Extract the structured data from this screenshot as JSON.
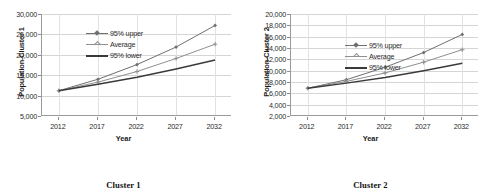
{
  "figure": {
    "panels": [
      {
        "caption": "Cluster 1",
        "ylabel": "Population-Cluster 1",
        "xlabel": "Year",
        "legend": [
          "95% upper",
          "Average",
          "95% lower"
        ],
        "chart_data": {
          "type": "line",
          "title": "Cluster 1",
          "xlabel": "Year",
          "ylabel": "Population-Cluster 1",
          "x": [
            2012,
            2017,
            2022,
            2027,
            2032
          ],
          "xtick_labels": [
            "2012",
            "2017",
            "2022",
            "2027",
            "2032"
          ],
          "ytick_labels": [
            "5,000",
            "10,000",
            "15,000",
            "20,000",
            "25,000",
            "30,000"
          ],
          "yticks": [
            5000,
            10000,
            15000,
            20000,
            25000,
            30000
          ],
          "ylim": [
            5000,
            30000
          ],
          "grid": true,
          "legend_position": "upper-left-inside",
          "series": [
            {
              "name": "95% upper",
              "values": [
                11200,
                14000,
                17600,
                21900,
                27200
              ],
              "color": "#6f6f6f",
              "marker": "diamond"
            },
            {
              "name": "Average",
              "values": [
                11200,
                13300,
                15900,
                19100,
                22600
              ],
              "color": "#8f8f8f",
              "marker": "plus"
            },
            {
              "name": "95% lower",
              "values": [
                11200,
                12800,
                14500,
                16500,
                18700
              ],
              "color": "#3a3a3a",
              "marker": "none"
            }
          ]
        }
      },
      {
        "caption": "Cluster 2",
        "ylabel": "Population-Cluster 2",
        "xlabel": "Year",
        "legend": [
          "95% upper",
          "Average",
          "95% lower"
        ],
        "chart_data": {
          "type": "line",
          "title": "Cluster 2",
          "xlabel": "Year",
          "ylabel": "Population-Cluster 2",
          "x": [
            2012,
            2017,
            2022,
            2027,
            2032
          ],
          "xtick_labels": [
            "2012",
            "2017",
            "2022",
            "2027",
            "2032"
          ],
          "ytick_labels": [
            "2,000",
            "4,000",
            "6,000",
            "8,000",
            "10,000",
            "12,000",
            "14,000",
            "16,000",
            "18,000",
            "20,000"
          ],
          "yticks": [
            2000,
            4000,
            6000,
            8000,
            10000,
            12000,
            14000,
            16000,
            18000,
            20000
          ],
          "ylim": [
            2000,
            20000
          ],
          "grid": true,
          "legend_position": "upper-left-inside",
          "series": [
            {
              "name": "95% upper",
              "values": [
                6900,
                8400,
                10600,
                13200,
                16400
              ],
              "color": "#6f6f6f",
              "marker": "diamond"
            },
            {
              "name": "Average",
              "values": [
                6900,
                8100,
                9600,
                11500,
                13700
              ],
              "color": "#8f8f8f",
              "marker": "plus"
            },
            {
              "name": "95% lower",
              "values": [
                6900,
                7800,
                8800,
                10000,
                11300
              ],
              "color": "#3a3a3a",
              "marker": "none"
            }
          ]
        }
      }
    ]
  }
}
